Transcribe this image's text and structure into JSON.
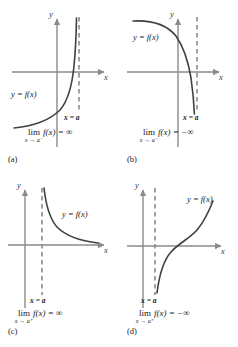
{
  "figure": {
    "background_color": "#ffffff",
    "curve_color": "#404040",
    "axis_color": "#8a8a8a",
    "asymptote_color": "#8a8a8a",
    "text_color": "#1a1a1a"
  },
  "common": {
    "y_axis_label": "y",
    "x_axis_label": "x",
    "function_label": "y = f(x)",
    "asymptote_label": "x = a",
    "lim_operator": "lim",
    "infinity": "∞",
    "neg_infinity": "−∞"
  },
  "panels": [
    {
      "tag": "(a)",
      "function_label": "y = f(x)",
      "asymptote_label": "x = a",
      "y_axis_label": "y",
      "x_axis_label": "x",
      "limit_operator": "lim",
      "limit_subscript": "x → a⁻",
      "limit_body": "f(x) = ∞",
      "limit_text": "lim x→a⁻ f(x) = ∞",
      "approach_side": "left",
      "limit_value": "+infinity",
      "description": "Curve rises steeply to +infinity as x approaches a from the left"
    },
    {
      "tag": "(b)",
      "function_label": "y = f(x)",
      "asymptote_label": "x = a",
      "y_axis_label": "y",
      "x_axis_label": "x",
      "limit_operator": "lim",
      "limit_subscript": "x → a⁻",
      "limit_body": "f(x) = −∞",
      "limit_text": "lim x→a⁻ f(x) = −∞",
      "approach_side": "left",
      "limit_value": "-infinity",
      "description": "Curve falls steeply to -infinity as x approaches a from the left"
    },
    {
      "tag": "(c)",
      "function_label": "y = f(x)",
      "asymptote_label": "x = a",
      "y_axis_label": "y",
      "x_axis_label": "x",
      "limit_operator": "lim",
      "limit_subscript": "x → a⁺",
      "limit_body": "f(x) = ∞",
      "limit_text": "lim x→a⁺ f(x) = ∞",
      "approach_side": "right",
      "limit_value": "+infinity",
      "description": "Curve descends from +infinity at x=a and flattens toward the x-axis"
    },
    {
      "tag": "(d)",
      "function_label": "y = f(x)",
      "asymptote_label": "x = a",
      "y_axis_label": "y",
      "x_axis_label": "x",
      "limit_operator": "lim",
      "limit_subscript": "x → a⁺",
      "limit_body": "f(x) = −∞",
      "limit_text": "lim x→a⁺ f(x) = −∞",
      "approach_side": "right",
      "limit_value": "-infinity",
      "description": "Curve rises from -infinity at x=a through the origin region and increases"
    }
  ]
}
